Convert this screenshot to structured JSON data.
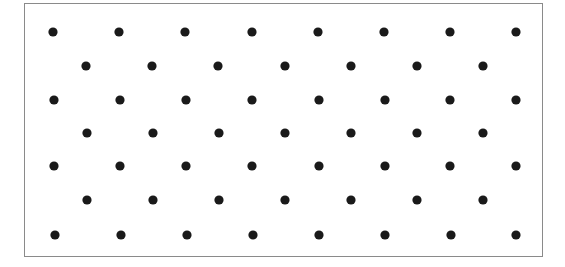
{
  "diagram": {
    "type": "dot-lattice",
    "frame": {
      "x": 24,
      "y": 3,
      "width": 519,
      "height": 254,
      "stroke": "#8a8a8a"
    },
    "dot": {
      "radius": 4.6,
      "color": "#1a1a1a"
    },
    "rows": [
      {
        "y": 32,
        "xs": [
          53,
          119,
          185,
          252,
          318,
          384,
          450,
          516
        ]
      },
      {
        "y": 66,
        "xs": [
          86,
          152,
          218,
          285,
          351,
          417,
          483
        ]
      },
      {
        "y": 100,
        "xs": [
          54,
          120,
          186,
          252,
          319,
          385,
          450,
          516
        ]
      },
      {
        "y": 133,
        "xs": [
          87,
          153,
          219,
          285,
          351,
          417,
          483
        ]
      },
      {
        "y": 166,
        "xs": [
          54,
          120,
          186,
          252,
          319,
          385,
          450,
          516
        ]
      },
      {
        "y": 200,
        "xs": [
          87,
          153,
          219,
          285,
          351,
          417,
          483
        ]
      },
      {
        "y": 235,
        "xs": [
          55,
          121,
          187,
          253,
          319,
          385,
          451,
          516
        ]
      }
    ],
    "counts": {
      "rows": 7,
      "dots_per_long_row": 8,
      "dots_per_short_row": 7,
      "total_dots": 53
    }
  }
}
